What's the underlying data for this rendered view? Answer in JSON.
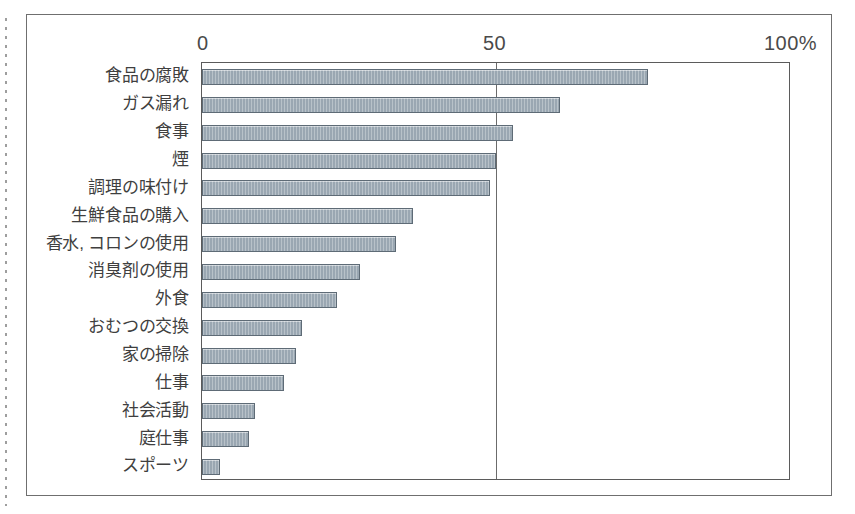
{
  "chart_data": {
    "type": "bar",
    "orientation": "horizontal",
    "title": "",
    "subtitle": "",
    "xlabel": "",
    "ylabel": "",
    "xlim": [
      0,
      100
    ],
    "grid": false,
    "legend": null,
    "axis_ticks": [
      "0",
      "50",
      "100%"
    ],
    "axis_tick_values": [
      0,
      50,
      100
    ],
    "categories": [
      "食品の腐敗",
      "ガス漏れ",
      "食事",
      "煙",
      "調理の味付け",
      "生鮮食品の購入",
      "香水, コロンの使用",
      "消臭剤の使用",
      "外食",
      "おむつの交換",
      "家の掃除",
      "仕事",
      "社会活動",
      "庭仕事",
      "スポーツ"
    ],
    "values": [
      76,
      61,
      53,
      50,
      49,
      36,
      33,
      27,
      23,
      17,
      16,
      14,
      9,
      8,
      3
    ],
    "unit": "%"
  },
  "colors": {
    "bar_fill": "#9aa7b2",
    "bar_stroke": "#5e6b76",
    "plot_border": "#5b5b5b",
    "frame_border": "#6f6f6f",
    "text": "#3f3f3f",
    "background": "#ffffff"
  }
}
